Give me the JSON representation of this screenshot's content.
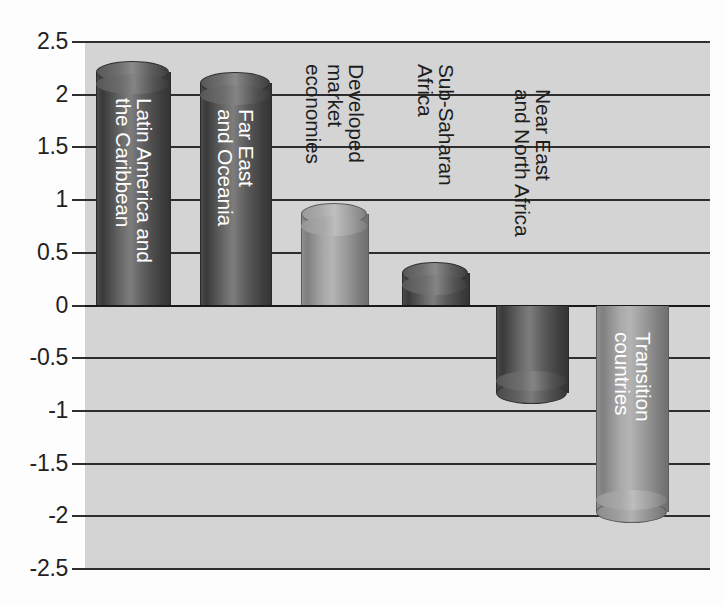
{
  "chart_data": {
    "type": "bar",
    "title": "",
    "subtitle": "",
    "xlabel": "",
    "ylabel": "",
    "orientation": "vertical",
    "grid": true,
    "legend": false,
    "ylim": [
      -2.5,
      2.5
    ],
    "ytick_labels": [
      "2.5",
      "2",
      "1.5",
      "1",
      "0.5",
      "0",
      "-0.5",
      "-1",
      "-1.5",
      "-2",
      "-2.5"
    ],
    "ytick_values": [
      2.5,
      2,
      1.5,
      1,
      0.5,
      0,
      -0.5,
      -1,
      -1.5,
      -2,
      -2.5
    ],
    "categories": [
      "Latin America and the Caribbean",
      "Far East and Oceania",
      "Developed market economies",
      "Sub-Saharan Africa",
      "Near East and North Africa",
      "Transition countries"
    ],
    "values": [
      2.22,
      2.11,
      0.87,
      0.31,
      -0.83,
      -1.96
    ],
    "bars": [
      {
        "category": "Latin America and the Caribbean",
        "value": 2.22,
        "label_lines": [
          "Latin America and",
          "the Caribbean"
        ],
        "label_position": "inside",
        "color": "#4a4a4a",
        "shade": "dark"
      },
      {
        "category": "Far East and Oceania",
        "value": 2.11,
        "label_lines": [
          "Far East",
          "and Oceania"
        ],
        "label_position": "inside",
        "color": "#4a4a4a",
        "shade": "dark"
      },
      {
        "category": "Developed market economies",
        "value": 0.87,
        "label_lines": [
          "Developed",
          "market",
          "economies"
        ],
        "label_position": "outside",
        "color": "#9b9b9b",
        "shade": "light"
      },
      {
        "category": "Sub-Saharan Africa",
        "value": 0.31,
        "label_lines": [
          "Sub-Saharan",
          "Africa"
        ],
        "label_position": "outside",
        "color": "#4a4a4a",
        "shade": "dark"
      },
      {
        "category": "Near East and North Africa",
        "value": -0.83,
        "label_lines": [
          "Near East",
          "and North Africa"
        ],
        "label_position": "outside",
        "color": "#3c3c3c",
        "shade": "dark"
      },
      {
        "category": "Transition countries",
        "value": -1.96,
        "label_lines": [
          "Transition",
          "countries"
        ],
        "label_position": "inside",
        "color": "#9b9b9b",
        "shade": "light"
      }
    ],
    "colors": {
      "plot_background": "#d4d4d4",
      "page_background": "#fdfdfd",
      "gridline": "#2e2e2e",
      "axis_text": "#222222",
      "label_inside": "#ffffff",
      "label_outside": "#1d1d1d"
    }
  }
}
